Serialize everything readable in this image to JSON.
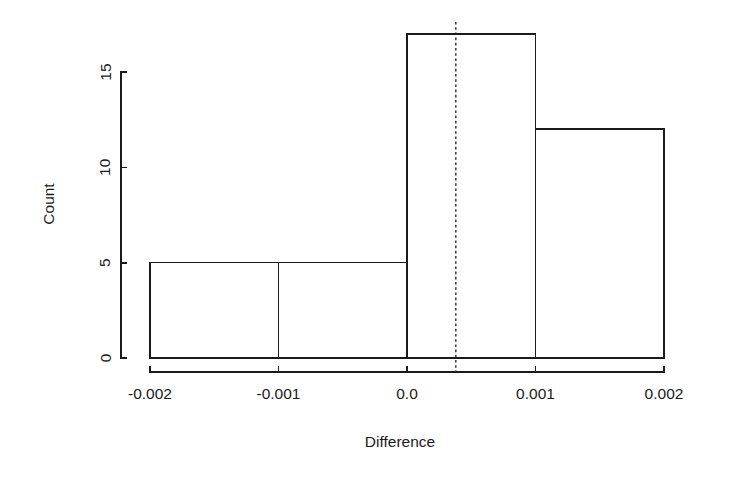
{
  "chart_data": {
    "type": "bar",
    "chart_style": "histogram",
    "title": "",
    "subtitle": "",
    "xlabel": "Difference",
    "ylabel": "Count",
    "categories": [
      "-0.002 to -0.001",
      "-0.001 to 0.0",
      "0.0 to 0.001",
      "0.001 to 0.002"
    ],
    "bin_edges": [
      -0.002,
      -0.001,
      0.0,
      0.001,
      0.002
    ],
    "values": [
      5,
      5,
      17,
      12
    ],
    "x": [
      -0.0015,
      -0.0005,
      0.0005,
      0.0015
    ],
    "xlim": [
      -0.002,
      0.002
    ],
    "ylim": [
      0,
      17.8
    ],
    "y_axis_range": [
      0,
      15
    ],
    "xticks": [
      -0.002,
      -0.001,
      0.0,
      0.001,
      0.002
    ],
    "xtick_labels": [
      "-0.002",
      "-0.001",
      "0.0",
      "0.001",
      "0.002"
    ],
    "yticks": [
      0,
      5,
      10,
      15
    ],
    "ytick_labels": [
      "0",
      "5",
      "10",
      "15"
    ],
    "grid": false,
    "legend": false,
    "legend_position": "none",
    "annotations": [
      {
        "type": "vertical-reference-line",
        "name": "mean-reference-line",
        "value": 0.00038,
        "style": "dashed",
        "color": "#1a1a1a",
        "label": ""
      }
    ],
    "bar_fill_color": "#ffffff",
    "bar_edge_color": "#1a1a1a",
    "background_color": "#ffffff"
  },
  "axes": {
    "y_title": "Count",
    "x_title": "Difference",
    "y_tick_labels": [
      "0",
      "5",
      "10",
      "15"
    ],
    "x_tick_labels": [
      "-0.002",
      "-0.001",
      "0.0",
      "0.001",
      "0.002"
    ]
  }
}
